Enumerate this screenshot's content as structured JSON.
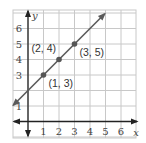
{
  "chart_data": {
    "type": "line",
    "title": "",
    "xlabel": "x",
    "ylabel": "y",
    "xlim": [
      -0.9,
      6.6
    ],
    "ylim": [
      -1,
      7
    ],
    "grid": true,
    "x_ticks": [
      "1",
      "2",
      "3",
      "4",
      "5",
      "6"
    ],
    "y_ticks": [
      "1",
      "3",
      "4",
      "5",
      "6"
    ],
    "line": {
      "slope": 1,
      "intercept": 2,
      "equation": "y = x + 2",
      "arrows_both_ends": true
    },
    "points": [
      {
        "x": 1,
        "y": 3,
        "label": "(1, 3)"
      },
      {
        "x": 2,
        "y": 4,
        "label": "(2, 4)"
      },
      {
        "x": 3,
        "y": 5,
        "label": "(3, 5)"
      }
    ],
    "colors": {
      "line": "#5a5a5a",
      "grid": "#c8c8c8",
      "axis": "#222222",
      "point": "#555555"
    }
  }
}
